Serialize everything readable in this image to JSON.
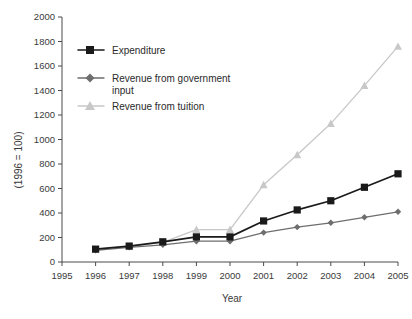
{
  "chart_data": {
    "type": "line",
    "title": "",
    "xlabel": "Year",
    "ylabel": "(1996 = 100)",
    "x": [
      1996,
      1997,
      1998,
      1999,
      2000,
      2001,
      2002,
      2003,
      2004,
      2005
    ],
    "xticklabels": [
      "1995",
      "1996",
      "1997",
      "1998",
      "1999",
      "2000",
      "2001",
      "2002",
      "2003",
      "2004",
      "2005"
    ],
    "yticklabels": [
      "0",
      "200",
      "400",
      "600",
      "800",
      "1000",
      "1200",
      "1400",
      "1600",
      "1800",
      "2000"
    ],
    "xlim": [
      1995,
      2005
    ],
    "ylim": [
      0,
      2000
    ],
    "grid": false,
    "legend_position": "upper-left",
    "series": [
      {
        "name": "Expenditure",
        "marker": "square",
        "color": "#1a1a1a",
        "values": [
          105,
          130,
          165,
          205,
          205,
          335,
          425,
          500,
          610,
          720
        ]
      },
      {
        "name": "Revenue from government input",
        "marker": "diamond",
        "color": "#6e6e6e",
        "values": [
          95,
          120,
          140,
          170,
          170,
          240,
          285,
          320,
          365,
          410
        ]
      },
      {
        "name": "Revenue from tuition",
        "marker": "triangle",
        "color": "#c8c8c8",
        "values": [
          105,
          125,
          160,
          265,
          265,
          630,
          875,
          1130,
          1440,
          1760
        ]
      }
    ]
  },
  "legend": {
    "items": [
      {
        "label": "Expenditure"
      },
      {
        "label": "Revenue from government"
      },
      {
        "label": "input"
      },
      {
        "label": "Revenue from tuition"
      }
    ]
  },
  "colors": {
    "expenditure": "#1a1a1a",
    "government": "#6e6e6e",
    "tuition": "#c8c8c8",
    "axis": "#4a4a4a",
    "background": "#ffffff"
  }
}
